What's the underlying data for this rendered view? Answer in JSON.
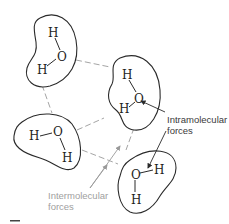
{
  "diagram": {
    "molecules": [
      {
        "id": "mol-top-left",
        "atoms": {
          "h1": "H",
          "o": "O",
          "h2": "H"
        }
      },
      {
        "id": "mol-center-right",
        "atoms": {
          "h1": "H",
          "o": "O",
          "h2": "H"
        }
      },
      {
        "id": "mol-middle-left",
        "atoms": {
          "h1": "H",
          "o": "O",
          "h2": "H"
        }
      },
      {
        "id": "mol-bottom-right",
        "atoms": {
          "h1": "H",
          "o": "O",
          "h2": "H"
        }
      }
    ],
    "labels": {
      "intramolecular_line1": "Intramolecular",
      "intramolecular_line2": "forces",
      "intermolecular_line1": "Intermolecular",
      "intermolecular_line2": "forces"
    },
    "colors": {
      "outline": "#2a2a2a",
      "intermolecular": "#9a9a9a",
      "intramolecular_label": "#3a3a3a",
      "intermolecular_label": "#a0a0a0"
    }
  }
}
